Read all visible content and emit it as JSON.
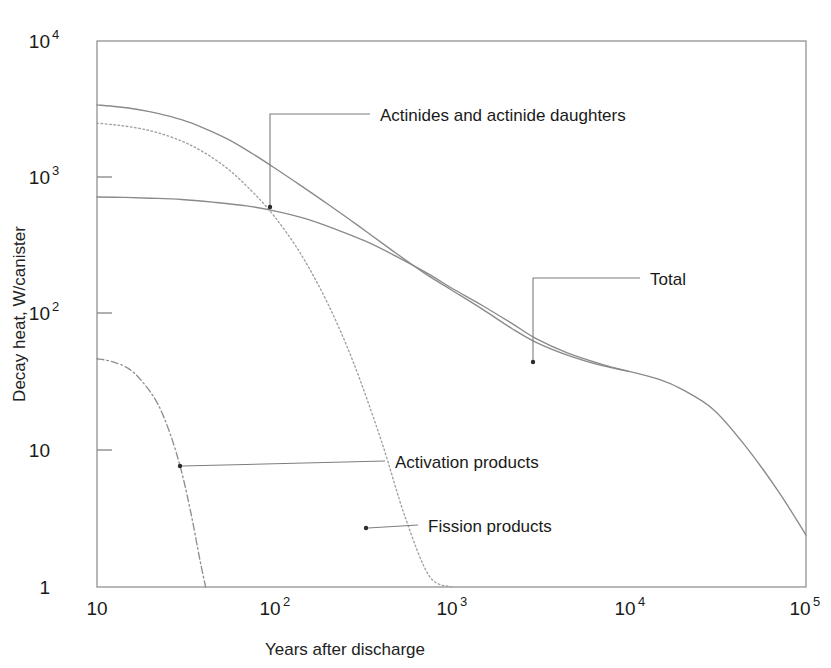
{
  "chart_data": {
    "type": "line",
    "title": "",
    "xlabel": "Years after discharge",
    "ylabel": "Decay heat, W/canister",
    "xscale": "log",
    "yscale": "log",
    "xlim": [
      10,
      100000
    ],
    "ylim": [
      1,
      10000
    ],
    "grid": false,
    "legend_position": "inline-annotations",
    "xticks": [
      {
        "value": 10,
        "base": "10",
        "exp": ""
      },
      {
        "value": 100,
        "base": "10",
        "exp": "2"
      },
      {
        "value": 1000,
        "base": "10",
        "exp": "3"
      },
      {
        "value": 10000,
        "base": "10",
        "exp": "4"
      },
      {
        "value": 100000,
        "base": "10",
        "exp": "5"
      }
    ],
    "yticks": [
      {
        "value": 1,
        "base": "1",
        "exp": ""
      },
      {
        "value": 10,
        "base": "10",
        "exp": ""
      },
      {
        "value": 100,
        "base": "10",
        "exp": "2"
      },
      {
        "value": 1000,
        "base": "10",
        "exp": "3"
      },
      {
        "value": 10000,
        "base": "10",
        "exp": "4"
      }
    ],
    "series": [
      {
        "name": "Total",
        "style": "solid",
        "annotation": "Total",
        "x": [
          10,
          13,
          17,
          22,
          30,
          40,
          55,
          75,
          100,
          140,
          200,
          300,
          450,
          700,
          1000,
          1500,
          2200,
          3000,
          4500,
          7000,
          10000,
          15000,
          20000,
          30000,
          45000,
          70000,
          100000
        ],
        "y": [
          3400,
          3300,
          3150,
          2950,
          2650,
          2300,
          1900,
          1500,
          1180,
          880,
          640,
          440,
          300,
          200,
          150,
          108,
          78,
          62,
          50,
          42,
          38,
          33,
          28,
          20,
          11,
          5.0,
          2.4
        ]
      },
      {
        "name": "Fission products",
        "style": "dotted",
        "annotation": "Fission products",
        "x": [
          10,
          13,
          17,
          22,
          30,
          40,
          55,
          75,
          100,
          140,
          200,
          280,
          400,
          550,
          750,
          1000
        ],
        "y": [
          2500,
          2420,
          2300,
          2130,
          1850,
          1530,
          1150,
          790,
          520,
          280,
          120,
          44,
          12,
          3.2,
          1.2,
          0.5
        ]
      },
      {
        "name": "Actinides and actinide daughters",
        "style": "solid",
        "annotation": "Actinides and actinide daughters",
        "x": [
          10,
          14,
          20,
          30,
          45,
          70,
          100,
          150,
          220,
          330,
          500,
          750,
          1000,
          1500,
          2200,
          3000,
          4500,
          7000,
          10000
        ],
        "y": [
          720,
          715,
          705,
          690,
          660,
          620,
          570,
          500,
          420,
          340,
          260,
          195,
          155,
          115,
          85,
          66,
          52,
          43,
          38
        ]
      },
      {
        "name": "Activation products",
        "style": "dash-dot",
        "annotation": "Activation products",
        "x": [
          10,
          12,
          15,
          18,
          22,
          26,
          30,
          34,
          38,
          41
        ],
        "y": [
          47,
          45,
          40,
          32,
          22,
          13,
          7.0,
          3.4,
          1.6,
          1.0
        ]
      }
    ],
    "annotations": [
      {
        "label": "Actinides and actinide daughters",
        "target_x": 100,
        "target_y": 640
      },
      {
        "label": "Total",
        "target_x": 2900,
        "target_y": 64
      },
      {
        "label": "Activation products",
        "target_x": 22,
        "target_y": 8.2
      },
      {
        "label": "Fission products",
        "target_x": 280,
        "target_y": 3.1
      }
    ]
  },
  "colors": {
    "curve": "#8a8a8a",
    "frame": "#9a9a9a",
    "text": "#1a1a1a",
    "leader": "#7d7d7d",
    "background": "#ffffff"
  }
}
